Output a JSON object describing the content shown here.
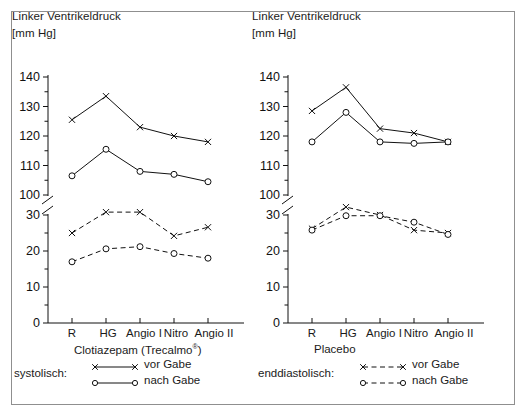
{
  "figure": {
    "background_color": "#ffffff",
    "border_color": "#8f8f8f",
    "line_color": "#111111"
  },
  "chart_data": [
    {
      "type": "line",
      "panel": "left",
      "title": "Linker Ventrikeldruck",
      "unit_label": "[mm Hg]",
      "ylabel": "Linker Ventrikeldruck [mm Hg]",
      "xlabel": "Clotiazepam (Trecalmo®)",
      "group_label": "Clotiazepam (Trecalmo®)",
      "categories": [
        "R",
        "HG",
        "Angio I",
        "Nitro",
        "Angio II"
      ],
      "yticks_lower": [
        0,
        10,
        20,
        30
      ],
      "yticks_upper": [
        100,
        110,
        120,
        130,
        140
      ],
      "ylim_lower": [
        0,
        35
      ],
      "ylim_upper": [
        97,
        140
      ],
      "axis_break": true,
      "grid": false,
      "legend_position": "below-left",
      "series": [
        {
          "name": "vor Gabe",
          "measure": "systolisch",
          "marker": "x",
          "linestyle": "solid",
          "values": [
            125.5,
            133.5,
            123.0,
            120.0,
            118.0
          ]
        },
        {
          "name": "nach Gabe",
          "measure": "systolisch",
          "marker": "o",
          "linestyle": "solid",
          "values": [
            106.5,
            115.5,
            108.0,
            107.0,
            104.5
          ]
        },
        {
          "name": "vor Gabe",
          "measure": "enddiastolisch",
          "marker": "x",
          "linestyle": "dashed",
          "values": [
            25.0,
            30.8,
            30.8,
            24.2,
            26.6
          ]
        },
        {
          "name": "nach Gabe",
          "measure": "enddiastolisch",
          "marker": "o",
          "linestyle": "dashed",
          "values": [
            17.0,
            20.6,
            21.2,
            19.3,
            18.0
          ]
        }
      ],
      "legend": {
        "group_name": "systolisch:",
        "entries": [
          {
            "label": "vor Gabe",
            "marker": "x",
            "linestyle": "solid"
          },
          {
            "label": "nach Gabe",
            "marker": "o",
            "linestyle": "solid"
          }
        ]
      }
    },
    {
      "type": "line",
      "panel": "right",
      "title": "Linker Ventrikeldruck",
      "unit_label": "[mm Hg]",
      "ylabel": "Linker Ventrikeldruck [mm Hg]",
      "xlabel": "Placebo",
      "group_label": "Placebo",
      "categories": [
        "R",
        "HG",
        "Angio I",
        "Nitro",
        "Angio II"
      ],
      "yticks_lower": [
        0,
        10,
        20,
        30
      ],
      "yticks_upper": [
        100,
        110,
        120,
        130,
        140
      ],
      "ylim_lower": [
        0,
        35
      ],
      "ylim_upper": [
        97,
        140
      ],
      "axis_break": true,
      "grid": false,
      "legend_position": "below-right",
      "series": [
        {
          "name": "vor Gabe",
          "measure": "systolisch",
          "marker": "x",
          "linestyle": "solid",
          "values": [
            128.5,
            136.5,
            122.5,
            121.0,
            118.0
          ]
        },
        {
          "name": "nach Gabe",
          "measure": "systolisch",
          "marker": "o",
          "linestyle": "solid",
          "values": [
            118.0,
            128.0,
            118.0,
            117.5,
            118.0
          ]
        },
        {
          "name": "vor Gabe",
          "measure": "enddiastolisch",
          "marker": "x",
          "linestyle": "dashed",
          "values": [
            26.2,
            32.2,
            30.0,
            25.8,
            25.0
          ]
        },
        {
          "name": "nach Gabe",
          "measure": "enddiastolisch",
          "marker": "o",
          "linestyle": "dashed",
          "values": [
            25.8,
            29.8,
            29.8,
            28.0,
            24.6
          ]
        }
      ],
      "legend": {
        "group_name": "enddiastolisch:",
        "entries": [
          {
            "label": "vor Gabe",
            "marker": "x",
            "linestyle": "dashed"
          },
          {
            "label": "nach Gabe",
            "marker": "o",
            "linestyle": "dashed"
          }
        ]
      }
    }
  ]
}
